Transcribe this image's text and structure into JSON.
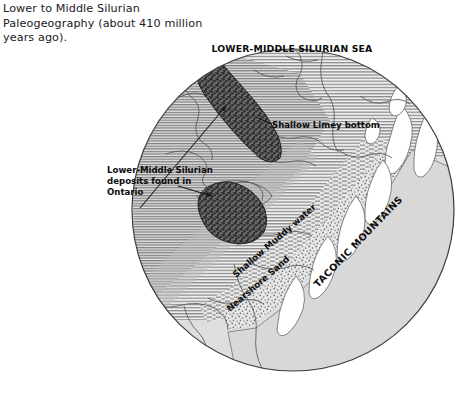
{
  "caption": {
    "line1": "Lower to Middle Silurian",
    "line2": "Paleogeography (about 410 million",
    "line3": "years ago)."
  },
  "map": {
    "title_sea": "LOWER-MIDDLE SILURIAN SEA",
    "label_limey": "Shallow Limey bottom",
    "label_deposits_l1": "Lower-Middle Silurian",
    "label_deposits_l2": "deposits found in",
    "label_deposits_l3": "Ontario",
    "label_muddy": "Shallow Muddy water",
    "label_sand": "Nearshore Sand",
    "label_mountains": "TACONIC MOUNTAINS"
  },
  "colors": {
    "sea_hatch": "#8d8d8d",
    "sea_fill": "#e9e9e9",
    "land_fill": "#dcdcdc",
    "highland_fill": "#ffffff",
    "deposit_fill": "#5a5a5a",
    "outline": "#555555",
    "circle_edge": "#3a3a3a",
    "text": "#111111"
  },
  "geometry": {
    "circle_cx": 293,
    "circle_cy": 210,
    "circle_r": 162
  }
}
